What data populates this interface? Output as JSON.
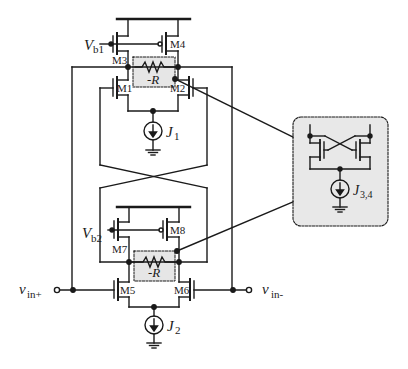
{
  "labels": {
    "vb1": "V",
    "vb1_sub": "b1",
    "vb2": "V",
    "vb2_sub": "b2",
    "m1": "M1",
    "m2": "M2",
    "m3": "M3",
    "m4": "M4",
    "m5": "M5",
    "m6": "M6",
    "m7": "M7",
    "m8": "M8",
    "negR_top": "-R",
    "negR_bottom": "-R",
    "j1": "J",
    "j1_sub": "1",
    "j2": "J",
    "j2_sub": "2",
    "j34": "J",
    "j34_sub": "3,4",
    "vin_plus": "v",
    "vin_plus_sub": "in+",
    "vin_minus": "v",
    "vin_minus_sub": "in-"
  },
  "colors": {
    "wire": "#1a1a1a",
    "highlight_fill": "#e6e6e6",
    "inset_fill": "#e8e8e8"
  }
}
